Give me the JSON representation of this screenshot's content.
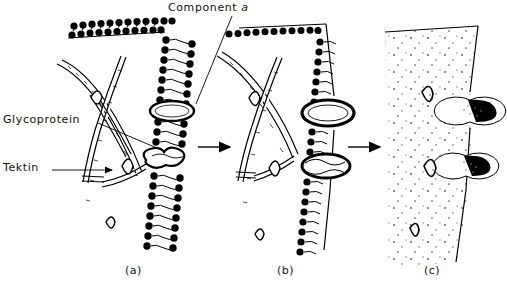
{
  "figure": {
    "background_color": "#ffffff",
    "ink_color": "#000000",
    "labels": {
      "glycoprotein": "Glycoprotein",
      "tektin": "Tektin",
      "component_prefix": "Component",
      "component_italic": "a"
    },
    "panels": [
      {
        "id": "a",
        "caption": "(a)",
        "description": "lipid bilayer cross-section with tektin filament network and component a rings"
      },
      {
        "id": "b",
        "caption": "(b)",
        "description": "single membrane leaflet with protruding component a rings"
      },
      {
        "id": "c",
        "caption": "(c)",
        "description": "stippled freeze-fracture face with particles and pits"
      }
    ],
    "arrows": [
      {
        "name": "arrow-a-to-b",
        "x1": 198,
        "y1": 147,
        "x2": 232,
        "y2": 147
      },
      {
        "name": "arrow-b-to-c",
        "x1": 348,
        "y1": 147,
        "x2": 382,
        "y2": 147
      }
    ],
    "leaders": {
      "glycoprotein": "diagonal line from label to glycoprotein lens in panel a",
      "tektin": "horizontal line with arrowhead to tektin filament",
      "component": "diagonal line from label down-left to component a ring"
    }
  }
}
